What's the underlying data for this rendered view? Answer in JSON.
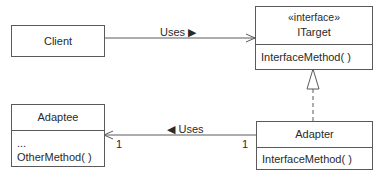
{
  "diagram": {
    "type": "UML class diagram",
    "classes": {
      "client": {
        "name": "Client"
      },
      "itarget": {
        "stereotype": "«interface»",
        "name": "ITarget",
        "methods": [
          "InterfaceMethod( )"
        ]
      },
      "adaptee": {
        "name": "Adaptee",
        "attributes": [
          "..."
        ],
        "methods": [
          "OtherMethod( )"
        ]
      },
      "adapter": {
        "name": "Adapter",
        "methods": [
          "InterfaceMethod( )"
        ]
      }
    },
    "relations": [
      {
        "from": "Client",
        "to": "ITarget",
        "kind": "association",
        "label": "Uses ▶"
      },
      {
        "from": "Adapter",
        "to": "Adaptee",
        "kind": "association",
        "label": "◀ Uses",
        "multiplicity_source": "1",
        "multiplicity_target": "1"
      },
      {
        "from": "Adapter",
        "to": "ITarget",
        "kind": "realization"
      }
    ]
  },
  "colors": {
    "line": "#5a5a5a",
    "text": "#2a2a2a",
    "background": "#ffffff"
  }
}
